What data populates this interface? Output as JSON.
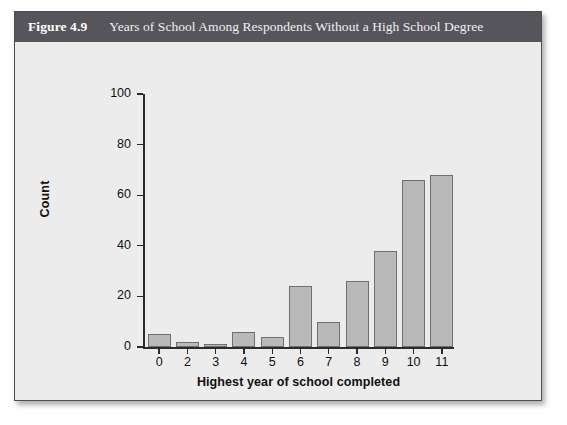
{
  "figure": {
    "number": "Figure 4.9",
    "caption": "Years of School Among Respondents Without a High School Degree"
  },
  "colors": {
    "header_bg": "#56555b",
    "panel_bg": "#ececed",
    "bar_fill": "#b9b9b9",
    "bar_border": "#6f6f6f",
    "axis": "#2b2b2b",
    "page_bg": "#ffffff"
  },
  "chart_data": {
    "type": "bar",
    "title": "Years of School Among Respondents Without a High School Degree",
    "xlabel": "Highest year of school completed",
    "ylabel": "Count",
    "categories": [
      "0",
      "2",
      "3",
      "4",
      "5",
      "6",
      "7",
      "8",
      "9",
      "10",
      "11"
    ],
    "values": [
      5,
      2,
      1,
      6,
      4,
      24,
      10,
      26,
      38,
      66,
      68
    ],
    "ylim": [
      0,
      100
    ],
    "yticks": [
      0,
      20,
      40,
      60,
      80,
      100
    ],
    "ytick_labels": [
      "0",
      "20",
      "40",
      "60",
      "80",
      "100"
    ],
    "grid": false,
    "legend": "none"
  }
}
